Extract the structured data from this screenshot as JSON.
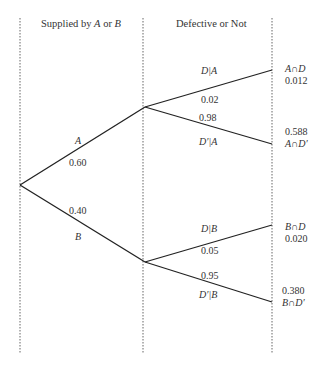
{
  "headers": {
    "stage1": {
      "prefix": "Supplied by ",
      "a": "A",
      "mid": " or ",
      "b": "B"
    },
    "stage2": "Defective or Not"
  },
  "first_level": {
    "A": {
      "event": "A",
      "prob": "0.60"
    },
    "B": {
      "event": "B",
      "prob": "0.40"
    }
  },
  "second_level": {
    "DA": {
      "event": "D|A",
      "prob": "0.02"
    },
    "DpA": {
      "event": "D′|A",
      "prob": "0.98"
    },
    "DB": {
      "event": "D|B",
      "prob": "0.05"
    },
    "DpB": {
      "event": "D′|B",
      "prob": "0.95"
    }
  },
  "outcomes": {
    "AD": {
      "event": "A∩D",
      "prob": "0.012"
    },
    "ADp": {
      "event": "A∩D′",
      "prob": "0.588"
    },
    "BD": {
      "event": "B∩D",
      "prob": "0.020"
    },
    "BDp": {
      "event": "B∩D′",
      "prob": "0.380"
    }
  }
}
